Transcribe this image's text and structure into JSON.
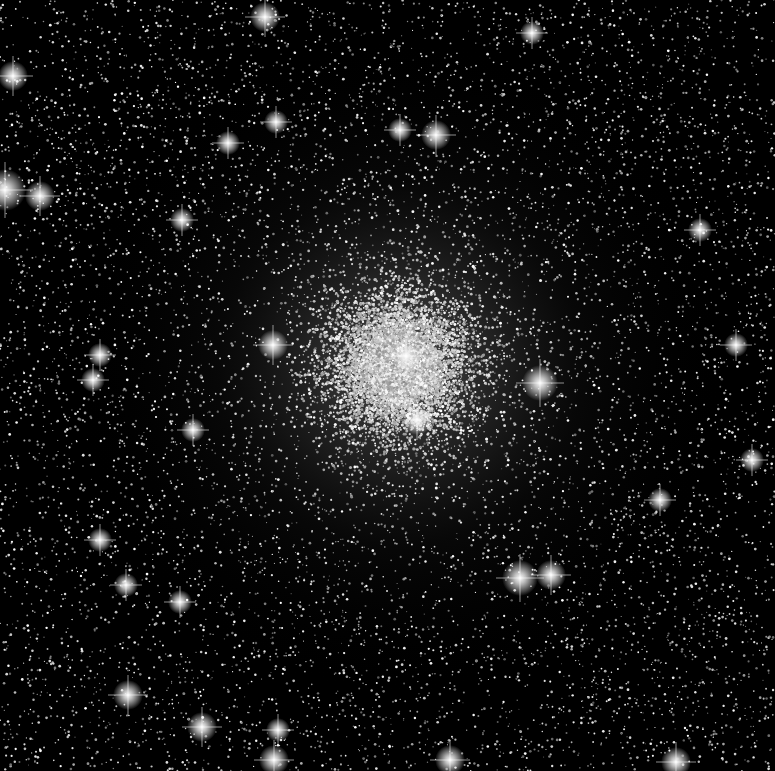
{
  "image": {
    "subject": "Globular star cluster",
    "width": 775,
    "height": 771,
    "colormap": "grayscale",
    "background": "#000000"
  },
  "cluster": {
    "center": [
      400,
      365
    ],
    "core_radius": 140,
    "halo_radius": 330,
    "core_glow_color": "#9a9a9a",
    "field_star_count": 9000,
    "cluster_star_count": 14000,
    "seed": 20240
  },
  "bright_stars": [
    {
      "x": 265,
      "y": 17,
      "r": 5
    },
    {
      "x": 532,
      "y": 33,
      "r": 4
    },
    {
      "x": 13,
      "y": 76,
      "r": 5
    },
    {
      "x": 400,
      "y": 130,
      "r": 4
    },
    {
      "x": 436,
      "y": 135,
      "r": 5
    },
    {
      "x": 276,
      "y": 122,
      "r": 4
    },
    {
      "x": 228,
      "y": 143,
      "r": 4
    },
    {
      "x": 5,
      "y": 190,
      "r": 7
    },
    {
      "x": 40,
      "y": 196,
      "r": 5
    },
    {
      "x": 182,
      "y": 220,
      "r": 4
    },
    {
      "x": 100,
      "y": 355,
      "r": 4
    },
    {
      "x": 93,
      "y": 380,
      "r": 4
    },
    {
      "x": 406,
      "y": 356,
      "r": 5
    },
    {
      "x": 540,
      "y": 383,
      "r": 6
    },
    {
      "x": 417,
      "y": 420,
      "r": 5
    },
    {
      "x": 273,
      "y": 345,
      "r": 5
    },
    {
      "x": 193,
      "y": 430,
      "r": 4
    },
    {
      "x": 736,
      "y": 345,
      "r": 4
    },
    {
      "x": 752,
      "y": 460,
      "r": 4
    },
    {
      "x": 520,
      "y": 578,
      "r": 6
    },
    {
      "x": 551,
      "y": 575,
      "r": 5
    },
    {
      "x": 126,
      "y": 585,
      "r": 4
    },
    {
      "x": 180,
      "y": 602,
      "r": 4
    },
    {
      "x": 202,
      "y": 727,
      "r": 5
    },
    {
      "x": 128,
      "y": 695,
      "r": 5
    },
    {
      "x": 278,
      "y": 730,
      "r": 4
    },
    {
      "x": 274,
      "y": 760,
      "r": 5
    },
    {
      "x": 450,
      "y": 760,
      "r": 5
    },
    {
      "x": 676,
      "y": 762,
      "r": 5
    },
    {
      "x": 100,
      "y": 540,
      "r": 4
    },
    {
      "x": 700,
      "y": 230,
      "r": 4
    },
    {
      "x": 660,
      "y": 500,
      "r": 4
    }
  ]
}
